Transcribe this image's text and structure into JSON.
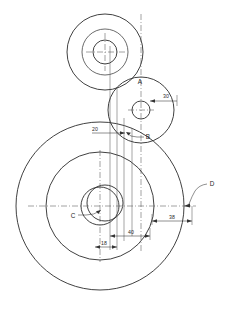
{
  "drawing": {
    "title": "Gear Train Assembly Outline Drawing",
    "background_color": "#ffffff",
    "line_color": "#2b2b2b",
    "centerline_color": "#555555",
    "width": 225,
    "height": 310,
    "part_labels": [
      {
        "id": "label-a",
        "text": "A",
        "x": 140,
        "y": 82
      },
      {
        "id": "label-b",
        "text": "B",
        "x": 148,
        "y": 137
      },
      {
        "id": "label-c",
        "text": "C",
        "x": 73,
        "y": 217
      },
      {
        "id": "label-d",
        "text": "D",
        "x": 211,
        "y": 186
      }
    ],
    "dimensions": [
      {
        "id": "dim-30",
        "text": "30",
        "x": 166,
        "y": 98
      },
      {
        "id": "dim-20",
        "text": "20",
        "x": 95,
        "y": 133
      },
      {
        "id": "dim-40",
        "text": "40",
        "x": 131,
        "y": 232
      },
      {
        "id": "dim-18",
        "text": "18",
        "x": 104,
        "y": 245
      },
      {
        "id": "dim-38",
        "text": "38",
        "x": 172,
        "y": 218
      }
    ],
    "circles": {
      "top_group": {
        "center_x": 105,
        "center_y": 52,
        "radii": [
          38,
          23,
          12
        ]
      },
      "middle_group": {
        "center_x": 141,
        "center_y": 110,
        "radii": [
          33,
          9
        ]
      },
      "bottom_group": {
        "center_x": 100,
        "center_y": 206,
        "radii": [
          84,
          54,
          19
        ],
        "offset_bore": {
          "center_x": 105,
          "center_y": 203,
          "radius": 18
        }
      }
    }
  }
}
